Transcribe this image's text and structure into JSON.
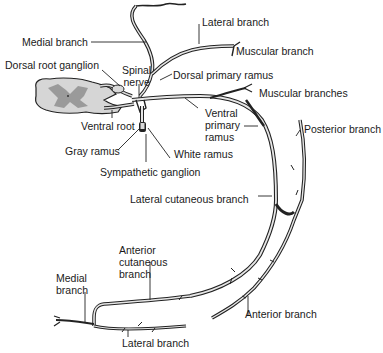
{
  "diagram": {
    "colors": {
      "nerve_stroke": "#222222",
      "nerve_fill": "#d9d9d9",
      "cord_fill": "#d6d6d6",
      "gray_matter": "#9a9a9a",
      "background": "#ffffff"
    },
    "labels": {
      "medial_branch_top": "Medial branch",
      "lateral_branch_top": "Lateral branch",
      "muscular_branch": "Muscular branch",
      "dorsal_root_ganglion": "Dorsal root ganglion",
      "spinal_nerve_1": "Spinal",
      "spinal_nerve_2": "nerve",
      "dorsal_primary_ramus": "Dorsal primary ramus",
      "muscular_branches": "Muscular branches",
      "ventral_root": "Ventral root",
      "ventral_primary_ramus_1": "Ventral",
      "ventral_primary_ramus_2": "primary",
      "ventral_primary_ramus_3": "ramus",
      "posterior_branch": "Posterior branch",
      "gray_ramus": "Gray ramus",
      "white_ramus": "White ramus",
      "sympathetic_ganglion": "Sympathetic ganglion",
      "lateral_cutaneous_branch": "Lateral cutaneous branch",
      "anterior_cutaneous_branch_1": "Anterior",
      "anterior_cutaneous_branch_2": "cutaneous",
      "anterior_cutaneous_branch_3": "branch",
      "medial_branch_bottom_1": "Medial",
      "medial_branch_bottom_2": "branch",
      "anterior_branch": "Anterior branch",
      "lateral_branch_bottom": "Lateral branch"
    }
  }
}
